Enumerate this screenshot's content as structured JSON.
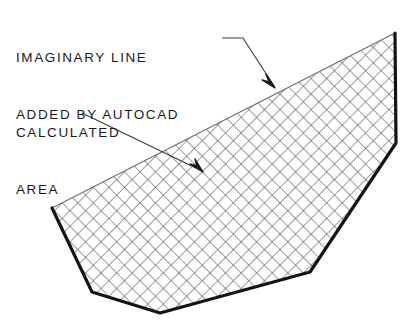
{
  "drawing": {
    "title": "AutoCAD calculated area with imaginary closing line",
    "background_color": "#ffffff",
    "outline_color": "#141414",
    "imaginary_line_color": "#6e6e6e",
    "hatch_color": "#4c4c4c",
    "leader_color": "#3a3a3a",
    "text_color": "#1a1a1a"
  },
  "annotations": {
    "imaginary": {
      "line1": "IMAGINARY LINE",
      "line2": "ADDED BY AUTOCAD"
    },
    "calculated": {
      "line1": "CALCULATED",
      "line2": "AREA"
    }
  },
  "geometry": {
    "polygon_points": "395,33 396,143 310,272 160,313 92,292 52,208",
    "solid_outline_path": "M 52,208 L 92,292 L 160,313 L 310,272 L 396,143 L 395,33",
    "imaginary_line_path": "M 52,208 L 395,33",
    "vertices": [
      {
        "name": "apex-top-right",
        "x": 395,
        "y": 33
      },
      {
        "name": "right-bend",
        "x": 396,
        "y": 143
      },
      {
        "name": "lower-right",
        "x": 310,
        "y": 272
      },
      {
        "name": "bottom",
        "x": 160,
        "y": 313
      },
      {
        "name": "lower-left",
        "x": 92,
        "y": 292
      },
      {
        "name": "left",
        "x": 52,
        "y": 208
      }
    ]
  },
  "leaders": {
    "imaginary_leader": {
      "path": "M 222,38 L 243,38 L 274,86",
      "arrow_points": "275,88 266,74 269,82 262,80"
    },
    "calculated_leader": {
      "path": "M 82,113 L 202,171",
      "arrow_points": "203,172 190,164 197,166 195,159"
    }
  },
  "hatch": {
    "pattern": "crosshatch-45",
    "spacing_px": 11,
    "line_width_px": 1
  }
}
